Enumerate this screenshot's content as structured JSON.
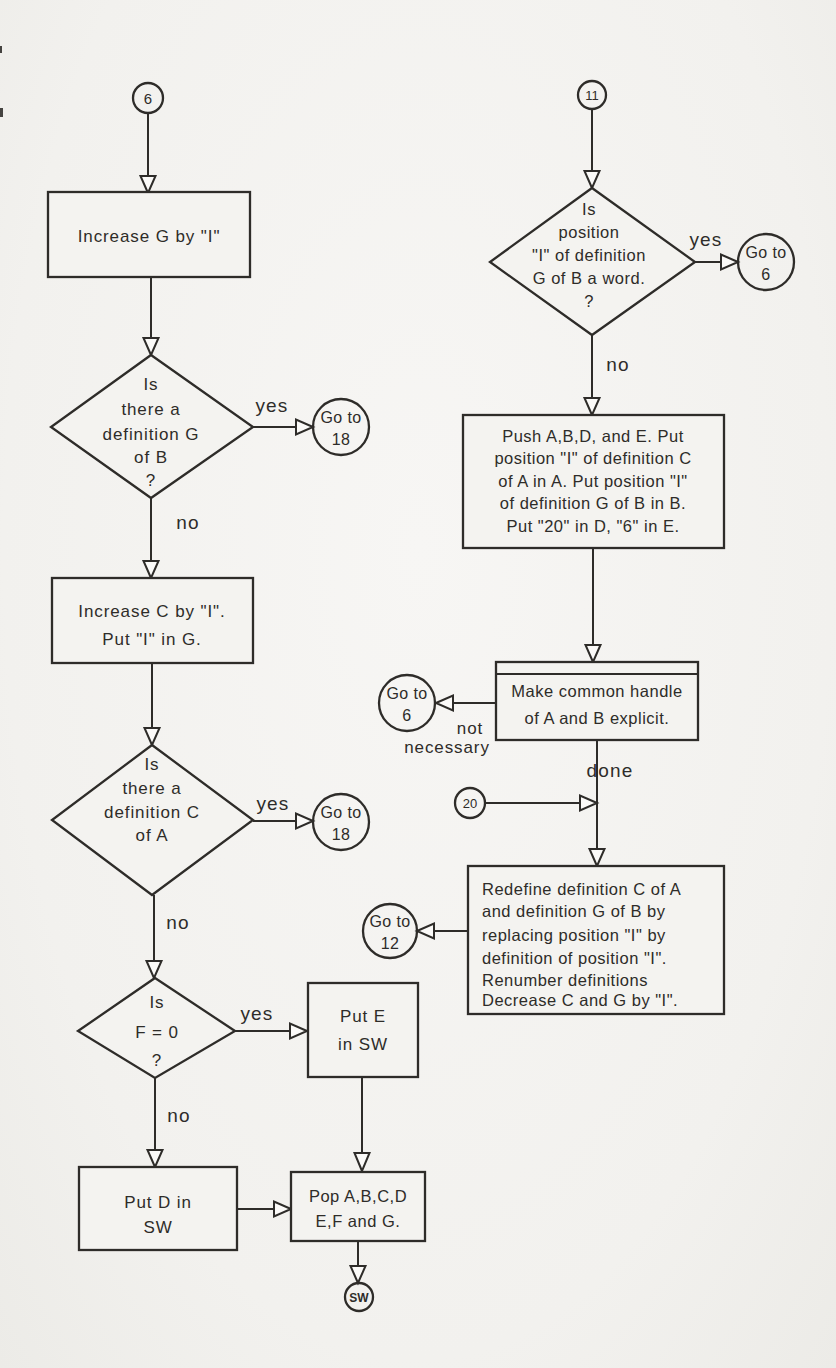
{
  "page": {
    "paper_color": "#f4f3f0",
    "ink_color": "#2e2c29"
  },
  "flowchart": {
    "left": {
      "connector_6": "6",
      "increase_g": "Increase G by \"I\"",
      "decision_def_g": [
        "Is",
        "there a",
        "definition G",
        "of B",
        "?"
      ],
      "goto_18_a": [
        "Go to",
        "18"
      ],
      "increase_c": [
        "Increase C by \"I\".",
        "Put \"I\" in G."
      ],
      "decision_def_c": [
        "Is",
        "there a",
        "definition C",
        "of A"
      ],
      "goto_18_b": [
        "Go to",
        "18"
      ],
      "decision_f0": [
        "Is",
        "F = 0",
        "?"
      ],
      "put_e_in_sw": [
        "Put E",
        "in SW"
      ],
      "put_d_in_sw": [
        "Put D in",
        "SW"
      ],
      "pop_registers": [
        "Pop A,B,C,D",
        "E,F and G."
      ],
      "connector_sw": "SW"
    },
    "right": {
      "connector_11": "11",
      "decision_word": [
        "Is",
        "position",
        "\"I\" of definition",
        "G of B a word.",
        "?"
      ],
      "goto_6_a": [
        "Go to",
        "6"
      ],
      "push_registers": [
        "Push A,B,D, and E.  Put",
        "position \"I\" of definition C",
        "of A in A.  Put position \"I\"",
        "of definition G of B in B.",
        "Put \"20\" in D, \"6\" in E."
      ],
      "make_handle": [
        "Make common handle",
        "of A and B explicit."
      ],
      "goto_6_b": [
        "Go to",
        "6"
      ],
      "connector_20": "20",
      "redefine": [
        "Redefine definition C of A",
        "and definition G of B by",
        "replacing position \"I\" by",
        "definition of position \"I\".",
        "Renumber definitions",
        "Decrease C and G by \"I\"."
      ],
      "goto_12": [
        "Go to",
        "12"
      ]
    },
    "labels": {
      "yes": "yes",
      "no": "no",
      "done": "done",
      "not_necessary": [
        "not",
        "necessary"
      ]
    }
  }
}
